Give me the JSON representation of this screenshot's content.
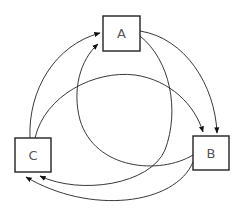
{
  "diagram": {
    "type": "directed-graph",
    "nodes": [
      {
        "id": "A",
        "label": "A"
      },
      {
        "id": "B",
        "label": "B"
      },
      {
        "id": "C",
        "label": "C"
      }
    ],
    "edges": [
      {
        "from": "C",
        "to": "A",
        "style": "outer-arc"
      },
      {
        "from": "B",
        "to": "A",
        "style": "inner-arc"
      },
      {
        "from": "A",
        "to": "B",
        "style": "outer-arc"
      },
      {
        "from": "C",
        "to": "B",
        "style": "inner-arc"
      },
      {
        "from": "A",
        "to": "C",
        "style": "inner-arc"
      },
      {
        "from": "B",
        "to": "C",
        "style": "outer-arc"
      }
    ],
    "colors": {
      "stroke": "#222222",
      "label": "#555555",
      "background": "#ffffff"
    }
  }
}
